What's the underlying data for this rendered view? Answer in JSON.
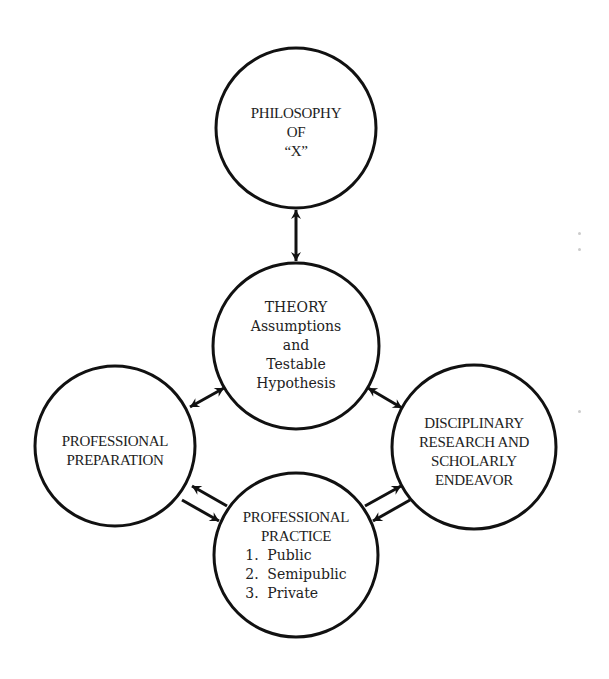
{
  "diagram": {
    "stroke_color": "#111111",
    "text_color": "#222222",
    "background": "#ffffff",
    "nodes": {
      "philosophy": {
        "lines": [
          "PHILOSOPHY",
          "OF",
          "“X”"
        ]
      },
      "theory": {
        "lines": [
          "THEORY",
          "Assumptions",
          "and",
          "Testable",
          "Hypothesis"
        ]
      },
      "preparation": {
        "lines": [
          "PROFESSIONAL",
          "PREPARATION"
        ]
      },
      "research": {
        "lines": [
          "DISCIPLINARY",
          "RESEARCH AND",
          "SCHOLARLY",
          "ENDEAVOR"
        ]
      },
      "practice": {
        "lines": [
          "PROFESSIONAL",
          "PRACTICE"
        ],
        "list": [
          {
            "num": "1.",
            "label": "Public"
          },
          {
            "num": "2.",
            "label": "Semipublic"
          },
          {
            "num": "3.",
            "label": "Private"
          }
        ]
      }
    },
    "edges": [
      {
        "from": "philosophy",
        "to": "theory",
        "type": "bidirectional"
      },
      {
        "from": "theory",
        "to": "preparation",
        "type": "bidirectional"
      },
      {
        "from": "theory",
        "to": "research",
        "type": "bidirectional"
      },
      {
        "from": "preparation",
        "to": "practice",
        "type": "two-way-parallel"
      },
      {
        "from": "research",
        "to": "practice",
        "type": "two-way-parallel"
      }
    ]
  }
}
